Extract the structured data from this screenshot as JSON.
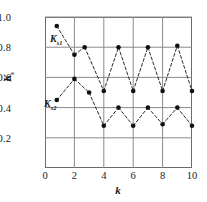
{
  "chart_data": {
    "type": "line",
    "title": "",
    "xlabel": "k",
    "ylabel": "K",
    "ylabel_sub": "s",
    "xlim": [
      0,
      10
    ],
    "ylim": [
      0,
      1.0
    ],
    "grid": true,
    "legend_position": "inline-annotations",
    "x_ticks": [
      "0",
      "2",
      "4",
      "6",
      "8",
      "10"
    ],
    "x_tick_values": [
      0,
      2,
      4,
      6,
      8,
      10
    ],
    "y_ticks": [
      "0.2",
      "0.4",
      "0.6",
      "0.8",
      "1.0"
    ],
    "y_tick_values": [
      0.2,
      0.4,
      0.6,
      0.8,
      1.0
    ],
    "series": [
      {
        "name": "Ks1",
        "label_main": "K",
        "label_sub": "s1",
        "x": [
          0.8,
          2.0,
          2.7,
          4.0,
          5.0,
          6.0,
          7.0,
          8.0,
          9.0,
          10.0
        ],
        "values": [
          0.94,
          0.75,
          0.8,
          0.51,
          0.8,
          0.51,
          0.8,
          0.51,
          0.81,
          0.51
        ]
      },
      {
        "name": "Ks2",
        "label_main": "K",
        "label_sub": "s2",
        "x": [
          0.8,
          2.0,
          3.0,
          4.0,
          5.0,
          6.0,
          7.0,
          8.0,
          9.0,
          10.0
        ],
        "values": [
          0.45,
          0.59,
          0.5,
          0.28,
          0.4,
          0.28,
          0.4,
          0.29,
          0.4,
          0.28
        ]
      }
    ]
  },
  "axes": {
    "y_title_main": "K",
    "y_title_sub": "s",
    "x_title": "k"
  },
  "annotations": {
    "series1_main": "K",
    "series1_sub": "s1",
    "series2_main": "K",
    "series2_sub": "s2"
  }
}
